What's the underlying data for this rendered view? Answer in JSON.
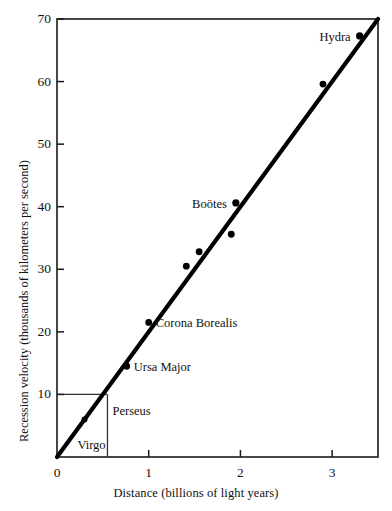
{
  "chart_data": {
    "type": "scatter",
    "title": "",
    "xlabel": "Distance (billions of light years)",
    "ylabel": "Recession velocity (thousands of kilometers per second)",
    "xlim": [
      0,
      3.5
    ],
    "ylim": [
      0,
      70
    ],
    "xticks": [
      0,
      1,
      2,
      3
    ],
    "xticklabels": [
      "0",
      "1",
      "2",
      "3"
    ],
    "yticks": [
      10,
      20,
      30,
      40,
      50,
      60,
      70
    ],
    "yticklabels": [
      "10",
      "20",
      "30",
      "40",
      "50",
      "60",
      "70"
    ],
    "grid": false,
    "legend": null,
    "frame": "box",
    "tick_direction": "in",
    "points": [
      {
        "name": "Virgo",
        "x": 0.07,
        "y": 1.2,
        "label": "Virgo",
        "label_side": "right",
        "label_dx": 14,
        "label_dy": 10,
        "marker_size": 0
      },
      {
        "name": "Perseus",
        "x": 0.3,
        "y": 6.0,
        "label": "Perseus",
        "label_side": "right",
        "label_dx": 28,
        "label_dy": 14,
        "marker_size": 3.0
      },
      {
        "name": "Ursa Major",
        "x": 0.76,
        "y": 14.5,
        "label": "Ursa Major",
        "label_side": "right",
        "label_dx": 7,
        "label_dy": 5,
        "marker_size": 3.4
      },
      {
        "name": "Corona Borealis",
        "x": 1.0,
        "y": 21.5,
        "label": "Corona Borealis",
        "label_side": "right",
        "label_dx": 7,
        "label_dy": 5,
        "marker_size": 3.4
      },
      {
        "name": "unlabeled-1",
        "x": 1.41,
        "y": 30.5,
        "label": "",
        "label_side": "right",
        "label_dx": 0,
        "label_dy": 0,
        "marker_size": 3.4
      },
      {
        "name": "unlabeled-2",
        "x": 1.55,
        "y": 32.8,
        "label": "",
        "label_side": "right",
        "label_dx": 0,
        "label_dy": 0,
        "marker_size": 3.4
      },
      {
        "name": "Bootes",
        "x": 1.95,
        "y": 40.6,
        "label": "Boötes",
        "label_side": "left",
        "label_dx": -9,
        "label_dy": 5,
        "marker_size": 3.6
      },
      {
        "name": "unlabeled-3",
        "x": 1.9,
        "y": 35.6,
        "label": "",
        "label_side": "right",
        "label_dx": 0,
        "label_dy": 0,
        "marker_size": 3.4
      },
      {
        "name": "unlabeled-4",
        "x": 2.9,
        "y": 59.6,
        "label": "",
        "label_side": "right",
        "label_dx": 0,
        "label_dy": 0,
        "marker_size": 3.4
      },
      {
        "name": "Hydra",
        "x": 3.3,
        "y": 67.3,
        "label": "Hydra",
        "label_side": "left",
        "label_dx": -9,
        "label_dy": 5,
        "marker_size": 3.6
      }
    ],
    "trend_line": {
      "name": "hubble-law-fit",
      "x0": 0.0,
      "y0": 0.0,
      "x1": 3.5,
      "y1": 70.0,
      "slope": 20.0,
      "width_px": 4.2
    },
    "guide_lines": [
      {
        "name": "horizontal-guide-10",
        "x0": 0.0,
        "y0": 10.0,
        "x1": 0.55,
        "y1": 10.0
      },
      {
        "name": "vertical-guide-055",
        "x0": 0.55,
        "y0": 10.0,
        "x1": 0.55,
        "y1": 0.0
      }
    ],
    "colors": {
      "axis": "#1a1a1a",
      "marker": "#000000",
      "trend_line": "#000000",
      "guide_line": "#333333",
      "background": "#ffffff",
      "text": "#111111"
    }
  },
  "figure": {
    "plot_left_px": 57,
    "plot_right_px": 378,
    "plot_top_px": 19,
    "plot_bottom_px": 457
  }
}
